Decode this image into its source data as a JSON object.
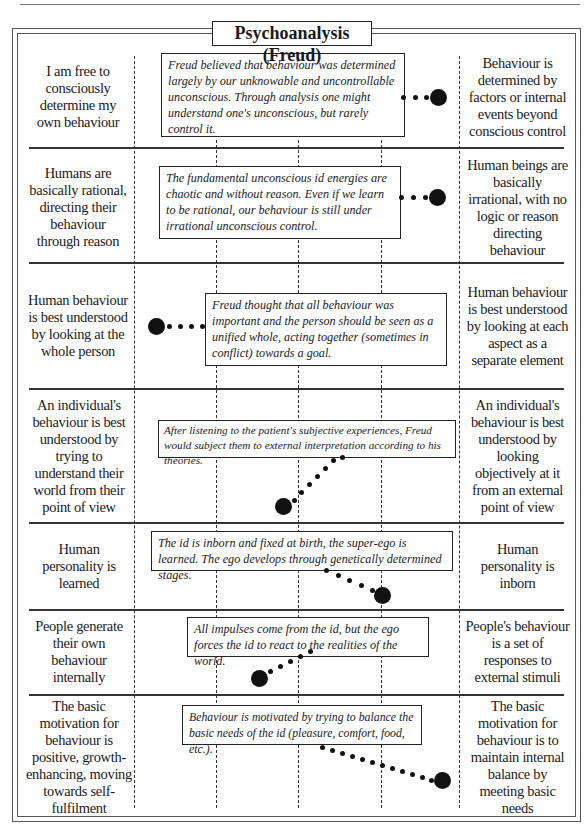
{
  "title": "Psychoanalysis (Freud)",
  "rows": [
    {
      "left": "I am free to consciously determine my own behaviour",
      "right": "Behaviour is determined by factors or internal events beyond conscious control",
      "description": "Freud believed that behaviour was determined largely by our unknowable and uncontrollable unconscious. Through analysis one might understand one's unconscious, but rarely control it.",
      "position": "far-right"
    },
    {
      "left": "Humans are basically rational, directing their behaviour through reason",
      "right": "Human beings are basically irrational, with no logic or reason directing behaviour",
      "description": "The fundamental unconscious id energies are chaotic and without reason. Even if we learn to be rational, our behaviour is still under irrational unconscious control.",
      "position": "far-right"
    },
    {
      "left": "Human behaviour is best understood by looking at the whole person",
      "right": "Human behaviour is best understood by looking at each aspect as a separate element",
      "description": "Freud thought that all behaviour was important and the person should be seen as a unified whole, acting together (sometimes in conflict) towards a goal.",
      "position": "far-left"
    },
    {
      "left": "An individual's behaviour is best understood by trying to understand their world from their point of view",
      "right": "An individual's behaviour is best understood by looking objectively at it from an external point of view",
      "description": "After listening to the patient's subjective experiences, Freud would subject them to external interpretation according to his theories.",
      "position": "centre-left"
    },
    {
      "left": "Human personality is learned",
      "right": "Human personality is inborn",
      "description": "The id is inborn and fixed at birth, the super-ego is learned. The ego develops through genetically determined stages.",
      "position": "right"
    },
    {
      "left": "People generate their own behaviour internally",
      "right": "People's behaviour is a set of responses to external stimuli",
      "description": "All impulses come from the id, but the ego forces the id to react to the realities of the world.",
      "position": "left"
    },
    {
      "left": "The basic motivation for behaviour is positive, growth-enhancing, moving towards self-fulfilment",
      "right": "The basic motivation for behaviour is to maintain internal balance by meeting basic needs",
      "description": "Behaviour is motivated by trying to balance the basic needs of the id (pleasure, comfort, food, etc.).",
      "position": "far-right"
    }
  ],
  "colors": {
    "ink": "#111111",
    "frame": "#555555",
    "background": "#ffffff"
  }
}
